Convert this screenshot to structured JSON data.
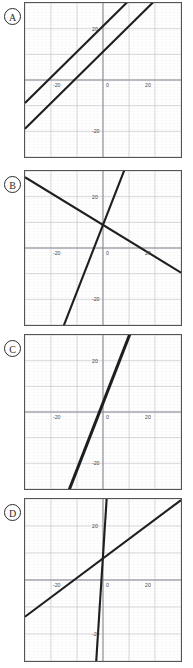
{
  "figure": {
    "title": "",
    "panel_count": 4,
    "width": 193,
    "height": 668,
    "background": "#ffffff",
    "frame_color": "#555555",
    "grid_color": "#c8c8d2",
    "axis_color": "#8a8a95",
    "line_color": "#1f1f1f",
    "tick_label_color": "#4a4a4a"
  },
  "panels": [
    {
      "id": "A",
      "label": "A",
      "geometry": {
        "left": 24,
        "top": 2,
        "width": 158,
        "height": 156
      },
      "chart_data": {
        "type": "line",
        "title": "",
        "xlabel": "",
        "ylabel": "",
        "xlim": [
          -30,
          30
        ],
        "ylim": [
          -30,
          30
        ],
        "grid": true,
        "grid_step": 10,
        "legend": "none",
        "xticks": [
          -20,
          0,
          20
        ],
        "xtick_labels": [
          "-20",
          "0",
          "20"
        ],
        "yticks": [
          20,
          -20
        ],
        "ytick_labels": [
          "20",
          "-20"
        ],
        "series": [
          {
            "name": "line-1",
            "slope": 1.0,
            "intercept": 21,
            "x": [
              -30,
              30
            ],
            "y": [
              -9,
              51
            ]
          },
          {
            "name": "line-2",
            "slope": 1.0,
            "intercept": 11,
            "x": [
              -30,
              30
            ],
            "y": [
              -19,
              41
            ]
          }
        ]
      }
    },
    {
      "id": "B",
      "label": "B",
      "geometry": {
        "left": 24,
        "top": 170,
        "width": 158,
        "height": 156
      },
      "chart_data": {
        "type": "line",
        "title": "",
        "xlabel": "",
        "ylabel": "",
        "xlim": [
          -30,
          30
        ],
        "ylim": [
          -30,
          30
        ],
        "grid": true,
        "grid_step": 10,
        "legend": "none",
        "xticks": [
          -20,
          0,
          20
        ],
        "xtick_labels": [
          "-20",
          "0",
          "20"
        ],
        "yticks": [
          20,
          -20
        ],
        "ytick_labels": [
          "20",
          "-20"
        ],
        "series": [
          {
            "name": "line-1",
            "slope": -0.62,
            "intercept": 9,
            "x": [
              -30,
              30
            ],
            "y": [
              27.6,
              -9.6
            ]
          },
          {
            "name": "line-2",
            "slope": 2.6,
            "intercept": 9,
            "x": [
              -30,
              30
            ],
            "y": [
              -69,
              87
            ]
          }
        ]
      }
    },
    {
      "id": "C",
      "label": "C",
      "geometry": {
        "left": 24,
        "top": 334,
        "width": 158,
        "height": 156
      },
      "chart_data": {
        "type": "line",
        "title": "",
        "xlabel": "",
        "ylabel": "",
        "xlim": [
          -30,
          30
        ],
        "ylim": [
          -30,
          30
        ],
        "grid": true,
        "grid_step": 10,
        "legend": "none",
        "xticks": [
          -20,
          0,
          20
        ],
        "xtick_labels": [
          "-20",
          "0",
          "20"
        ],
        "yticks": [
          20,
          -20
        ],
        "ytick_labels": [
          "20",
          "-20"
        ],
        "series": [
          {
            "name": "line-1",
            "slope": 2.6,
            "intercept": 4,
            "x": [
              -30,
              30
            ],
            "y": [
              -74,
              82
            ]
          },
          {
            "name": "line-2",
            "slope": 2.6,
            "intercept": 3,
            "x": [
              -30,
              30
            ],
            "y": [
              -75,
              81
            ]
          }
        ]
      }
    },
    {
      "id": "D",
      "label": "D",
      "geometry": {
        "left": 24,
        "top": 498,
        "width": 158,
        "height": 164
      },
      "chart_data": {
        "type": "line",
        "title": "",
        "xlabel": "",
        "ylabel": "",
        "xlim": [
          -30,
          30
        ],
        "ylim": [
          -30,
          30
        ],
        "grid": true,
        "grid_step": 10,
        "legend": "none",
        "xticks": [
          -20,
          0,
          20
        ],
        "xtick_labels": [
          "-20",
          "0",
          "20"
        ],
        "yticks": [
          20,
          -20
        ],
        "ytick_labels": [
          "20",
          "-20"
        ],
        "series": [
          {
            "name": "line-1",
            "slope": 0.72,
            "intercept": 8,
            "x": [
              -30,
              30
            ],
            "y": [
              -13.6,
              29.6
            ]
          },
          {
            "name": "line-2",
            "slope": 15,
            "intercept": 9,
            "x": [
              -3,
              2
            ],
            "y": [
              -36,
              39
            ]
          }
        ]
      }
    }
  ]
}
